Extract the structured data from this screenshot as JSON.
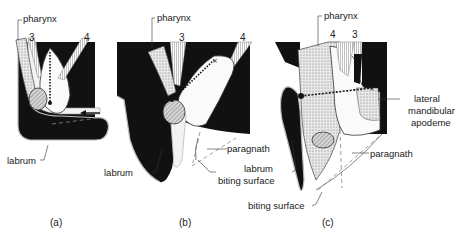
{
  "figure": {
    "panels": [
      {
        "id": "a",
        "caption": "(a)",
        "labels": {
          "pharynx": "pharynx",
          "labrum": "labrum",
          "muscle_3": "3",
          "muscle_4": "4"
        }
      },
      {
        "id": "b",
        "caption": "(b)",
        "labels": {
          "pharynx": "pharynx",
          "labrum": "labrum",
          "paragnath": "paragnath",
          "biting_surface": "biting surface",
          "muscle_3": "3",
          "muscle_4": "4"
        }
      },
      {
        "id": "c",
        "caption": "(c)",
        "labels": {
          "pharynx": "pharynx",
          "labrum": "labrum",
          "paragnath": "paragnath",
          "biting_surface": "biting surface",
          "lateral_mandibular_apodeme_1": "lateral",
          "lateral_mandibular_apodeme_2": "mandibular",
          "lateral_mandibular_apodeme_3": "apodeme",
          "muscle_4": "4",
          "muscle_3": "3"
        }
      }
    ],
    "colors": {
      "ink": "#111111",
      "paper": "#ffffff",
      "stipple": "#bdbdbd",
      "hatch": "#8a8a8a"
    }
  }
}
